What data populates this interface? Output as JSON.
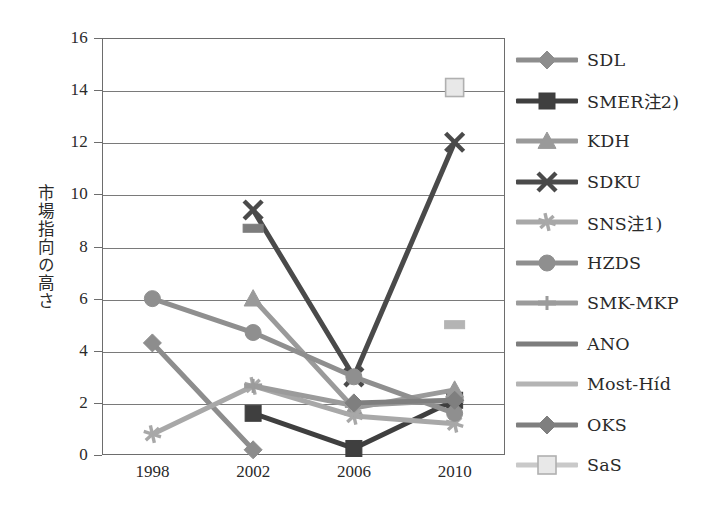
{
  "chart_data": {
    "type": "line",
    "title": "",
    "xlabel": "",
    "ylabel": "市場指向の高さ",
    "x": [
      "1998",
      "2002",
      "2006",
      "2010"
    ],
    "categories": [
      "1998",
      "2002",
      "2006",
      "2010"
    ],
    "ylim": [
      0,
      16
    ],
    "ytick_step": 2,
    "yticks": [
      "0",
      "2",
      "4",
      "6",
      "8",
      "10",
      "12",
      "14",
      "16"
    ],
    "grid": true,
    "legend_position": "right",
    "series": [
      {
        "name": "SDL",
        "marker": "diamond",
        "color": "#8d8d8d",
        "values": [
          4.3,
          0.2,
          null,
          null
        ]
      },
      {
        "name": "SMER注2)",
        "marker": "square",
        "color": "#3f3f3f",
        "values": [
          null,
          1.6,
          0.25,
          2.1
        ]
      },
      {
        "name": "KDH",
        "marker": "triangle",
        "color": "#9a9a9a",
        "values": [
          null,
          6.0,
          1.8,
          2.5
        ]
      },
      {
        "name": "SDKU",
        "marker": "x",
        "color": "#4a4a4a",
        "values": [
          null,
          9.4,
          3.0,
          12.0
        ]
      },
      {
        "name": "SNS注1)",
        "marker": "star",
        "color": "#a8a8a8",
        "values": [
          0.8,
          2.65,
          1.5,
          1.2
        ]
      },
      {
        "name": "HZDS",
        "marker": "circle",
        "color": "#8f8f8f",
        "values": [
          6.0,
          4.7,
          3.0,
          1.6
        ]
      },
      {
        "name": "SMK-MKP",
        "marker": "bar",
        "color": "#9b9b9b",
        "values": [
          null,
          2.65,
          1.9,
          2.1
        ]
      },
      {
        "name": "ANO",
        "marker": "none",
        "color": "#7d7d7d",
        "values": [
          null,
          8.7,
          null,
          null
        ]
      },
      {
        "name": "Most-Híd",
        "marker": "none",
        "color": "#b4b4b4",
        "values": [
          null,
          null,
          null,
          5.0
        ]
      },
      {
        "name": "OKS",
        "marker": "diamond",
        "color": "#7f7f7f",
        "values": [
          null,
          null,
          2.0,
          2.1
        ]
      },
      {
        "name": "SaS",
        "marker": "square-open",
        "color": "#c9c9c9",
        "values": [
          null,
          null,
          null,
          14.1
        ]
      }
    ]
  },
  "axis": {
    "y_title": "市場指向の高さ"
  }
}
